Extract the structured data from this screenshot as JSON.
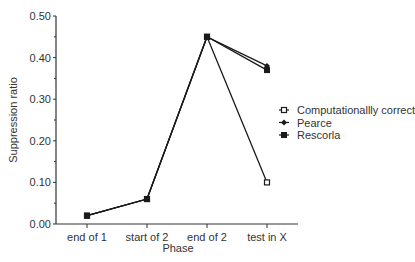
{
  "chart_data": {
    "type": "line",
    "title": "",
    "xlabel": "Phase",
    "ylabel": "Suppression ratio",
    "ylim": [
      0,
      0.5
    ],
    "yticks": [
      "0.00",
      "0.10",
      "0.20",
      "0.30",
      "0.40",
      "0.50"
    ],
    "categories": [
      "end of 1",
      "start of 2",
      "end of 2",
      "test in X"
    ],
    "grid": false,
    "legend_position": "right",
    "series": [
      {
        "name": "Computationallly correct",
        "marker": "open-square",
        "values": [
          0.02,
          0.06,
          0.45,
          0.1
        ]
      },
      {
        "name": "Pearce",
        "marker": "filled-diamond",
        "values": [
          0.02,
          0.06,
          0.45,
          0.38
        ]
      },
      {
        "name": "Rescorla",
        "marker": "filled-square",
        "values": [
          0.02,
          0.06,
          0.45,
          0.37
        ]
      }
    ]
  },
  "colors": {
    "line": "#1a1a1a",
    "axis": "#333333",
    "text": "#333333"
  }
}
